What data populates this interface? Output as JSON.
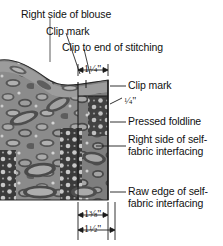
{
  "figure": {
    "labels": [
      {
        "id": "right-side-of-blouse",
        "text": "Right side of blouse"
      },
      {
        "id": "clip-mark-top",
        "text": "Clip mark"
      },
      {
        "id": "clip-to-end-of-stitching",
        "text": "Clip to end of stitching"
      },
      {
        "id": "clip-mark-right",
        "text": "Clip mark"
      },
      {
        "id": "pressed-foldline",
        "text": "Pressed foldline"
      },
      {
        "id": "right-side-of-self-fabric-interfacing",
        "text": "Right side of self-fabric interfacing"
      },
      {
        "id": "raw-edge-of-self-fabric-interfacing",
        "text": "Raw edge of self-fabric interfacing"
      }
    ],
    "dimensions": [
      {
        "id": "dim-top",
        "whole": "1",
        "num": "1",
        "den": "4",
        "unit": "\"",
        "text": "1 1/4\""
      },
      {
        "id": "dim-quarter",
        "whole": "",
        "num": "1",
        "den": "4",
        "unit": "\"",
        "text": "1/4\""
      },
      {
        "id": "dim-bottom-upper",
        "whole": "1",
        "num": "3",
        "den": "8",
        "unit": "\"",
        "text": "1 3/8\""
      },
      {
        "id": "dim-bottom-lower",
        "whole": "1",
        "num": "1",
        "den": "2",
        "unit": "\"",
        "text": "1 1/2\""
      }
    ],
    "colors": {
      "ink": "#111111",
      "fabric_mid": "#8e8e8e",
      "fabric_dark": "#4a4a4a",
      "fabric_light": "#c9c9c9",
      "background": "#ffffff"
    }
  }
}
